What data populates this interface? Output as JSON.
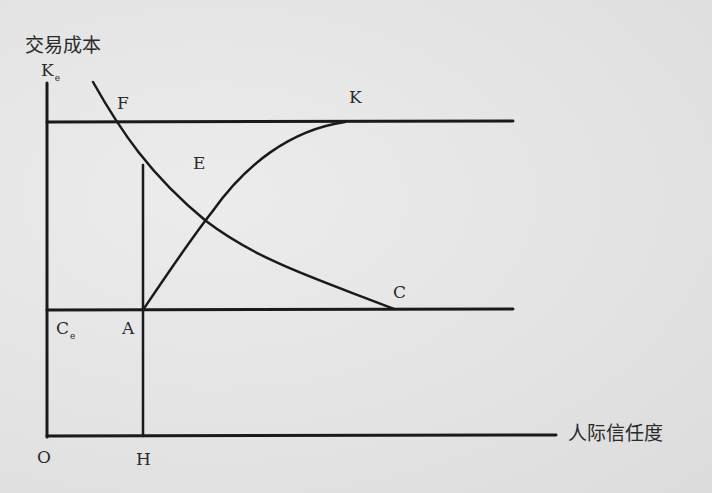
{
  "diagram": {
    "y_axis_label": "交易成本",
    "x_axis_label": "人际信任度",
    "origin_label": "O",
    "y_top_label": {
      "main": "K",
      "sub": "e"
    },
    "cost_floor_label": {
      "main": "C",
      "sub": "e"
    },
    "points": {
      "F": "F",
      "E": "E",
      "K": "K",
      "C": "C",
      "A": "A",
      "H": "H"
    },
    "curves": [
      {
        "name": "FC",
        "description": "decreasing convex curve from F down to C"
      },
      {
        "name": "AK",
        "description": "increasing concave curve from A up to K"
      }
    ],
    "lines": [
      {
        "name": "Ke-level",
        "description": "horizontal line at K_e"
      },
      {
        "name": "Ce-level",
        "description": "horizontal line at C_e"
      },
      {
        "name": "AH",
        "description": "vertical line through A down to H"
      }
    ],
    "colors": {
      "ink": "#1a1a1a",
      "paper": "#e6e6e6"
    }
  }
}
